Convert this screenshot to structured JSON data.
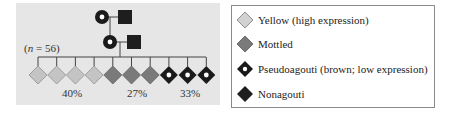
{
  "pedigree": {
    "sample_size_prefix": "(",
    "sample_size_var": "n",
    "sample_size_suffix": " = 56)",
    "generations": [
      {
        "members": [
          {
            "sex": "female",
            "phenotype": "pseudoagouti"
          },
          {
            "sex": "male",
            "phenotype": "nonagouti"
          }
        ]
      },
      {
        "members": [
          {
            "sex": "female",
            "phenotype": "pseudoagouti"
          },
          {
            "sex": "male",
            "phenotype": "nonagouti"
          }
        ]
      }
    ],
    "offspring": [
      "yellow",
      "yellow",
      "yellow",
      "yellow",
      "mottled",
      "mottled",
      "mottled",
      "pseudoagouti",
      "pseudoagouti",
      "pseudoagouti"
    ],
    "percentages": [
      {
        "label": "40%",
        "group": "yellow"
      },
      {
        "label": "27%",
        "group": "mottled"
      },
      {
        "label": "33%",
        "group": "pseudoagouti"
      }
    ]
  },
  "legend": {
    "items": [
      {
        "key": "yellow",
        "label": "Yellow (high expression)"
      },
      {
        "key": "mottled",
        "label": "Mottled"
      },
      {
        "key": "pseudoagouti",
        "label": "Pseudoagouti (brown; low expression)"
      },
      {
        "key": "nonagouti",
        "label": "Nonagouti"
      }
    ]
  },
  "colors": {
    "panel_bg": "#e6e6e6",
    "yellow": "#c4c4c4",
    "mottled": "#7a7a7a",
    "pseudoagouti": "#1a1a1a",
    "nonagouti": "#1e1e1e",
    "line": "#444444"
  }
}
